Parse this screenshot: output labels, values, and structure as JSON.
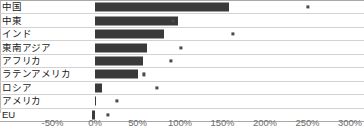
{
  "chart_data": {
    "type": "bar",
    "title": "",
    "subtitle": "",
    "xlabel": "",
    "ylabel": "",
    "orientation": "horizontal",
    "grid": false,
    "legend": "none",
    "xlim": [
      -50,
      300
    ],
    "xticks": [
      -50,
      0,
      50,
      100,
      150,
      200,
      250,
      300
    ],
    "xtick_labels": [
      "-50%",
      "0%",
      "50%",
      "100%",
      "150%",
      "200%",
      "250%",
      "300%"
    ],
    "categories": [
      "中国",
      "中東",
      "インド",
      "東南アジア",
      "アフリカ",
      "ラテンアメリカ",
      "ロシア",
      "アメリカ",
      "EU"
    ],
    "series": [
      {
        "name": "bar",
        "type": "bar",
        "values": [
          158,
          98,
          81,
          61,
          56,
          50,
          8,
          1,
          -3
        ]
      },
      {
        "name": "marker",
        "type": "scatter",
        "values": [
          250,
          92,
          162,
          101,
          89,
          58,
          73,
          26,
          15
        ]
      }
    ],
    "colors": {
      "bar": "#3a3a3a",
      "marker": "#4a4a4a",
      "gridline": "#d2d2d2",
      "axis_text": "#6d6d6d",
      "label_text": "#1a1a1a",
      "background": "#ffffff"
    }
  }
}
